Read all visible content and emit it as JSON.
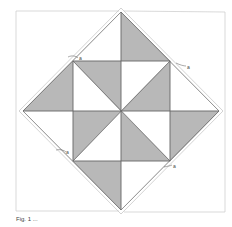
{
  "diagram": {
    "type": "quilt-block",
    "colors": {
      "shade": "#b8b8b8",
      "line": "#666666",
      "outline": "#cccccc",
      "background": "#ffffff"
    },
    "markers": [
      "a",
      "a",
      "a",
      "a"
    ]
  },
  "caption": "Fig. 1 ..."
}
